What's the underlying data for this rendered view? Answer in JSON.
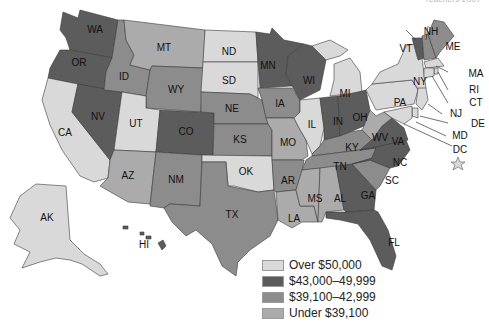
{
  "header": {
    "text": "Teachers 2007"
  },
  "legend": {
    "items": [
      {
        "key": "over50",
        "label": "Over $50,000",
        "color": "#d9d9d9"
      },
      {
        "key": "r43",
        "label": "$43,000–49,999",
        "color": "#5c5c5c"
      },
      {
        "key": "r39",
        "label": "$39,100–42,999",
        "color": "#8c8c8c"
      },
      {
        "key": "under",
        "label": "Under $39,100",
        "color": "#ababab"
      }
    ]
  },
  "states": {
    "WA": "r43",
    "OR": "r43",
    "CA": "over50",
    "NV": "r43",
    "ID": "r39",
    "MT": "under",
    "WY": "r39",
    "UT": "over50",
    "AZ": "under",
    "CO": "r43",
    "NM": "r39",
    "ND": "over50",
    "SD": "over50",
    "NE": "r39",
    "KS": "r39",
    "OK": "over50",
    "TX": "r39",
    "MN": "r43",
    "IA": "r39",
    "MO": "under",
    "AR": "r39",
    "LA": "under",
    "WI": "r43",
    "IL": "over50",
    "MI": "over50",
    "IN": "r43",
    "OH": "r43",
    "KY": "r39",
    "TN": "r39",
    "MS": "under",
    "AL": "under",
    "GA": "r43",
    "FL": "r43",
    "SC": "r39",
    "NC": "r43",
    "VA": "r43",
    "WV": "under",
    "PA": "over50",
    "NY": "over50",
    "VT": "r43",
    "NH": "r39",
    "ME": "r39",
    "MA": "over50",
    "RI": "over50",
    "CT": "over50",
    "NJ": "over50",
    "DE": "over50",
    "MD": "over50",
    "DC": "over50",
    "AK": "over50",
    "HI": "r43"
  },
  "labels": {
    "WA": "WA",
    "OR": "OR",
    "CA": "CA",
    "NV": "NV",
    "ID": "ID",
    "MT": "MT",
    "WY": "WY",
    "UT": "UT",
    "AZ": "AZ",
    "CO": "CO",
    "NM": "NM",
    "ND": "ND",
    "SD": "SD",
    "NE": "NE",
    "KS": "KS",
    "OK": "OK",
    "TX": "TX",
    "MN": "MN",
    "IA": "IA",
    "MO": "MO",
    "AR": "AR",
    "LA": "LA",
    "WI": "WI",
    "IL": "IL",
    "MI": "MI",
    "IN": "IN",
    "OH": "OH",
    "KY": "KY",
    "TN": "TN",
    "MS": "MS",
    "AL": "AL",
    "GA": "GA",
    "FL": "FL",
    "SC": "SC",
    "NC": "NC",
    "VA": "VA",
    "WV": "WV",
    "PA": "PA",
    "NY": "NY",
    "VT": "VT",
    "NH": "NH",
    "ME": "ME",
    "MA": "MA",
    "RI": "RI",
    "CT": "CT",
    "NJ": "NJ",
    "DE": "DE",
    "MD": "MD",
    "DC": "DC",
    "AK": "AK",
    "HI": "HI"
  }
}
